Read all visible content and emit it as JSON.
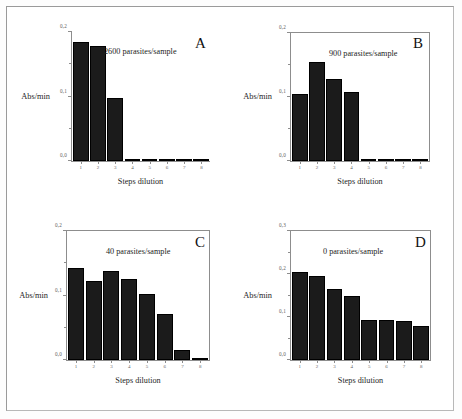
{
  "figure": {
    "axis_title_y": "Abs/min",
    "axis_title_x": "Steps dilution",
    "background_color": "#ffffff",
    "bar_color": "#1b1b1b",
    "axis_color": "#8d8d8d"
  },
  "panels": [
    {
      "letter": "A",
      "annotation": "2600 parasites/sample",
      "axis_title_y": "Abs/min",
      "axis_title_x": "Steps dilution",
      "y_ticks": [
        "0,0",
        "0,1",
        "0,2"
      ],
      "x_ticks": [
        "1",
        "2",
        "3",
        "4",
        "5",
        "6",
        "7",
        "8"
      ]
    },
    {
      "letter": "B",
      "annotation": "900 parasites/sample",
      "axis_title_y": "Abs/min",
      "axis_title_x": "Steps dilution",
      "y_ticks": [
        "0,0",
        "0,1",
        "0,2"
      ],
      "x_ticks": [
        "1",
        "2",
        "3",
        "4",
        "5",
        "6",
        "7",
        "8"
      ]
    },
    {
      "letter": "C",
      "annotation": "40 parasites/sample",
      "axis_title_y": "Abs/min",
      "axis_title_x": "Steps dilution",
      "y_ticks": [
        "0,0",
        "0,1",
        "0,2"
      ],
      "x_ticks": [
        "1",
        "2",
        "3",
        "4",
        "5",
        "6",
        "7",
        "8"
      ]
    },
    {
      "letter": "D",
      "annotation": "0 parasites/sample",
      "axis_title_y": "Abs/min",
      "axis_title_x": "Steps dilution",
      "y_ticks": [
        "0,0",
        "0,1",
        "0,2",
        "0,3"
      ],
      "x_ticks": [
        "1",
        "2",
        "3",
        "4",
        "5",
        "6",
        "7",
        "8"
      ]
    }
  ],
  "chart_data": [
    {
      "type": "bar",
      "panel": "A",
      "title": "2600 parasites/sample",
      "xlabel": "Steps dilution",
      "ylabel": "Abs/min",
      "categories": [
        "1",
        "2",
        "3",
        "4",
        "5",
        "6",
        "7",
        "8"
      ],
      "values": [
        0.185,
        0.178,
        0.098,
        0.003,
        0.002,
        0.001,
        0.001,
        0.001
      ],
      "ylim": [
        0.0,
        0.2
      ],
      "ytick_values": [
        0.0,
        0.1,
        0.2
      ],
      "ytick_labels": [
        "0,0",
        "0,1",
        "0,2"
      ],
      "grid": false,
      "legend": "none",
      "frame": "left-bottom"
    },
    {
      "type": "bar",
      "panel": "B",
      "title": "900 parasites/sample",
      "xlabel": "Steps dilution",
      "ylabel": "Abs/min",
      "categories": [
        "1",
        "2",
        "3",
        "4",
        "5",
        "6",
        "7",
        "8"
      ],
      "values": [
        0.105,
        0.155,
        0.128,
        0.108,
        0.003,
        0.002,
        0.001,
        0.001
      ],
      "ylim": [
        0.0,
        0.2
      ],
      "ytick_values": [
        0.0,
        0.1,
        0.2
      ],
      "ytick_labels": [
        "0,0",
        "0,1",
        "0,2"
      ],
      "grid": false,
      "legend": "none",
      "frame": "box"
    },
    {
      "type": "bar",
      "panel": "C",
      "title": "40 parasites/sample",
      "xlabel": "Steps dilution",
      "ylabel": "Abs/min",
      "categories": [
        "1",
        "2",
        "3",
        "4",
        "5",
        "6",
        "7",
        "8"
      ],
      "values": [
        0.142,
        0.123,
        0.138,
        0.125,
        0.103,
        0.072,
        0.015,
        0.003
      ],
      "ylim": [
        0.0,
        0.2
      ],
      "ytick_values": [
        0.0,
        0.1,
        0.2
      ],
      "ytick_labels": [
        "0,0",
        "0,1",
        "0,2"
      ],
      "grid": false,
      "legend": "none",
      "frame": "box"
    },
    {
      "type": "bar",
      "panel": "D",
      "title": "0 parasites/sample",
      "xlabel": "Steps dilution",
      "ylabel": "Abs/min",
      "categories": [
        "1",
        "2",
        "3",
        "4",
        "5",
        "6",
        "7",
        "8"
      ],
      "values": [
        0.205,
        0.195,
        0.165,
        0.148,
        0.093,
        0.093,
        0.09,
        0.08
      ],
      "ylim": [
        0.0,
        0.3
      ],
      "ytick_values": [
        0.0,
        0.1,
        0.2,
        0.3
      ],
      "ytick_labels": [
        "0,0",
        "0,1",
        "0,2",
        "0,3"
      ],
      "grid": false,
      "legend": "none",
      "frame": "box"
    }
  ]
}
